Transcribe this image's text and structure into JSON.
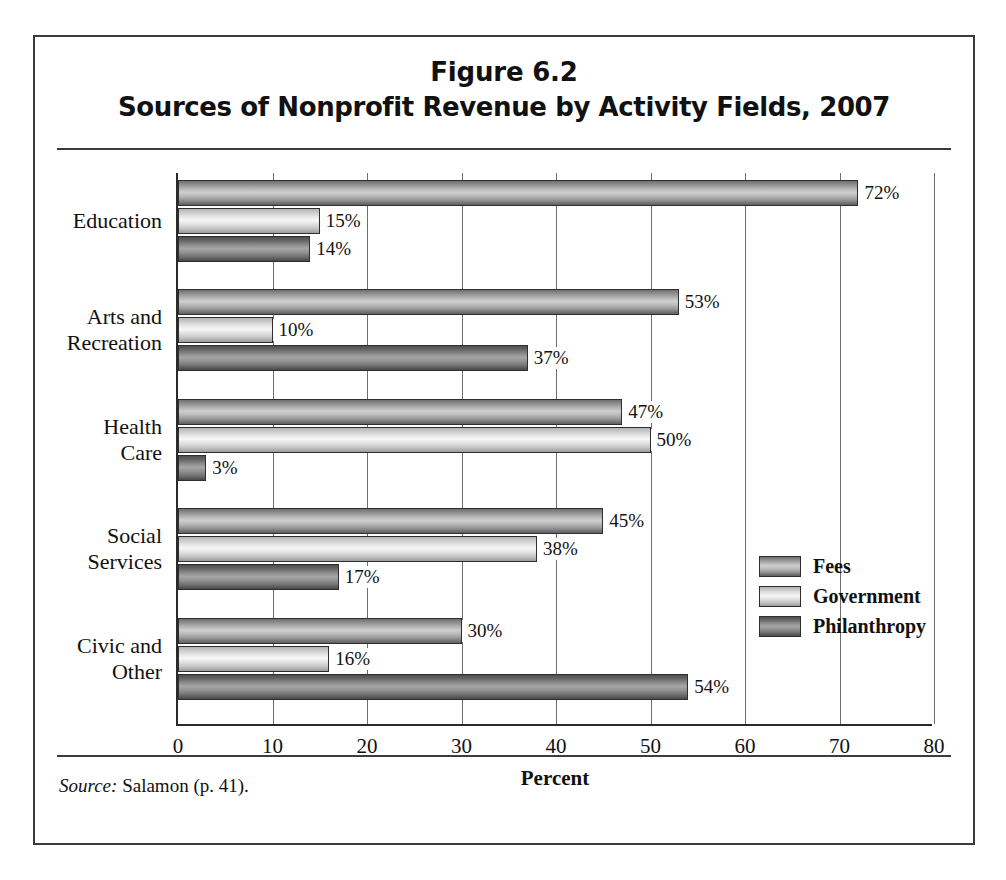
{
  "figure": {
    "title_line_1": "Figure 6.2",
    "title_line_2": "Sources of Nonprofit Revenue by Activity Fields, 2007",
    "source_label": "Source:",
    "source_text": " Salamon (p. 41)."
  },
  "chart_data": {
    "type": "bar",
    "orientation": "horizontal",
    "xlabel": "Percent",
    "ylabel": "",
    "xlim": [
      0,
      80
    ],
    "xticks": [
      0,
      10,
      20,
      30,
      40,
      50,
      60,
      70,
      80
    ],
    "xtick_labels": [
      "0",
      "10",
      "20",
      "30",
      "40",
      "50",
      "60",
      "70",
      "80"
    ],
    "grid": "vertical",
    "legend_position": "center-right",
    "categories": [
      "Education",
      "Arts and Recreation",
      "Health Care",
      "Social Services",
      "Civic and Other"
    ],
    "category_lines": [
      [
        "Education"
      ],
      [
        "Arts and",
        "Recreation"
      ],
      [
        "Health",
        "Care"
      ],
      [
        "Social",
        "Services"
      ],
      [
        "Civic and",
        "Other"
      ]
    ],
    "series": [
      {
        "name": "Fees",
        "color": "#b5b5b5",
        "values": [
          72,
          53,
          47,
          45,
          30
        ],
        "labels": [
          "72%",
          "53%",
          "47%",
          "45%",
          "30%"
        ]
      },
      {
        "name": "Government",
        "color": "#e8e8e8",
        "values": [
          15,
          10,
          50,
          38,
          16
        ],
        "labels": [
          "15%",
          "10%",
          "50%",
          "38%",
          "16%"
        ]
      },
      {
        "name": "Philanthropy",
        "color": "#8c8c8c",
        "values": [
          14,
          37,
          3,
          17,
          54
        ],
        "labels": [
          "14%",
          "37%",
          "3%",
          "17%",
          "54%"
        ]
      }
    ]
  },
  "legend": {
    "items": [
      {
        "label": "Fees",
        "key": "fees"
      },
      {
        "label": "Government",
        "key": "government"
      },
      {
        "label": "Philanthropy",
        "key": "philanthropy"
      }
    ]
  }
}
